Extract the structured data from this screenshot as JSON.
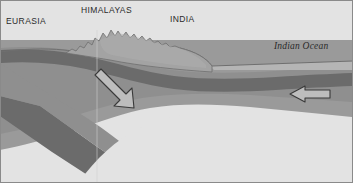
{
  "figure": {
    "width": 353,
    "height": 183,
    "background": "#ffffff"
  },
  "labels": {
    "eurasia": "EURASIA",
    "himalayas": "HIMALAYAS",
    "india": "INDIA",
    "indian_ocean": "Indian Ocean"
  },
  "colors": {
    "background": "#ffffff",
    "border": "#8a8a8a",
    "sky": "#ffffff",
    "mountain_fill": "#a3a3a3",
    "mountain_outline": "#6f6f6f",
    "upper_crust": "#8f8f8f",
    "dark_crust": "#6b6b6b",
    "slab_band": "#6b6b6b",
    "mid_layer": "#9a9a9a",
    "lower_mantle": "#e3e3e3",
    "ocean_water": "#b5b5b5",
    "ocean_surface_line": "#6f6f6f",
    "arrow_fill": "#bdbdbd",
    "arrow_outline": "#3a3a3a",
    "text": "#2a2a2a"
  },
  "arrows": [
    {
      "name": "subduction-arrow",
      "direction": "down-left",
      "meaning": "Indian plate subducting beneath Eurasia",
      "x": 100,
      "y": 112
    },
    {
      "name": "plate-motion-arrow",
      "direction": "left",
      "meaning": "Indian plate moving north-west toward Eurasia",
      "x": 310,
      "y": 94
    }
  ],
  "layers": [
    {
      "name": "mountain-range",
      "label": "Himalayas topography",
      "tone": "#a3a3a3"
    },
    {
      "name": "upper-crust",
      "label": "Upper crust",
      "tone": "#8f8f8f"
    },
    {
      "name": "dark-lithosphere",
      "label": "Lithospheric mantle",
      "tone": "#6b6b6b"
    },
    {
      "name": "mid-mantle",
      "label": "Upper mantle",
      "tone": "#9a9a9a"
    },
    {
      "name": "lower-mantle",
      "label": "Asthenosphere",
      "tone": "#e3e3e3"
    },
    {
      "name": "ocean-water",
      "label": "Indian Ocean water",
      "tone": "#b5b5b5"
    }
  ]
}
